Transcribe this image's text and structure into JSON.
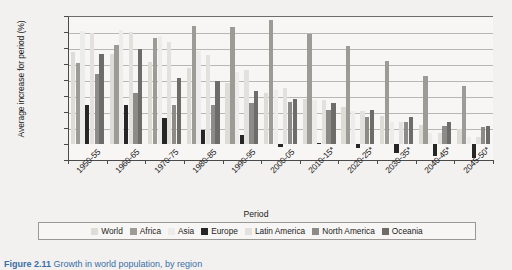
{
  "caption": {
    "number": "Figure 2.11",
    "text": "Growth in world population, by region"
  },
  "chart_data": {
    "type": "bar",
    "title": "",
    "xlabel": "Period",
    "ylabel": "Average increase for period (%)",
    "ylim": [
      -2,
      16
    ],
    "ytick_labels": [
      "16.00%",
      "14.00%",
      "12.00%",
      "10.00%",
      "8.00%",
      "6.00%",
      "4.00%",
      "2.00%",
      "0.00%",
      "-2.00%"
    ],
    "ytick_values": [
      16,
      14,
      12,
      10,
      8,
      6,
      4,
      2,
      0,
      -2
    ],
    "grid": true,
    "legend_position": "bottom",
    "categories": [
      "1950-55",
      "1960-65",
      "1970-75",
      "1980-85",
      "1990-95",
      "2000-05",
      "2010-15*",
      "2020-25*",
      "2030-35*",
      "2040-45*",
      "2045-50*"
    ],
    "series": [
      {
        "name": "World",
        "color": "#dedcd7",
        "values": [
          11.5,
          11.2,
          10.3,
          9.5,
          7.6,
          6.4,
          5.6,
          4.6,
          3.5,
          2.4,
          1.9
        ]
      },
      {
        "name": "Africa",
        "color": "#9d9b96",
        "values": [
          10.1,
          12.4,
          13.2,
          14.7,
          14.6,
          15.5,
          13.7,
          12.2,
          10.4,
          8.5,
          7.3
        ]
      },
      {
        "name": "Asia",
        "color": "#ececea",
        "values": [
          14.1,
          14.3,
          13.5,
          11.6,
          9.0,
          6.8,
          5.5,
          4.1,
          2.7,
          1.4,
          0.9
        ]
      },
      {
        "name": "Europe",
        "color": "#262626",
        "values": [
          4.9,
          4.9,
          3.2,
          1.8,
          1.1,
          -0.4,
          0.1,
          -0.5,
          -1.1,
          -1.5,
          -1.7
        ]
      },
      {
        "name": "Latin America",
        "color": "#e3e1dd",
        "values": [
          13.9,
          14.0,
          12.7,
          11.1,
          9.2,
          7.0,
          5.5,
          4.1,
          2.7,
          1.4,
          0.9
        ]
      },
      {
        "name": "North America",
        "color": "#8d8b87",
        "values": [
          8.8,
          6.4,
          4.9,
          4.9,
          5.1,
          5.2,
          4.3,
          3.4,
          2.7,
          2.3,
          2.1
        ]
      },
      {
        "name": "Oceania",
        "color": "#6e6c69",
        "values": [
          11.2,
          11.9,
          8.2,
          7.9,
          6.6,
          5.6,
          5.1,
          4.2,
          3.4,
          2.7,
          2.3
        ]
      }
    ]
  }
}
